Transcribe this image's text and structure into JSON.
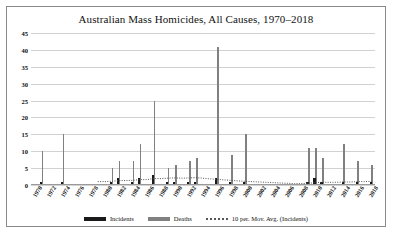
{
  "chart_data": {
    "type": "bar",
    "title": "Australian Mass Homicides, All Causes, 1970–2018",
    "xlabel": "",
    "ylabel": "",
    "ylim": [
      0,
      45
    ],
    "ytick_step": 5,
    "yticks": [
      "0",
      "5",
      "10",
      "15",
      "20",
      "25",
      "30",
      "35",
      "40",
      "45"
    ],
    "grid": true,
    "legend_position": "bottom",
    "x": [
      1970,
      1971,
      1972,
      1973,
      1974,
      1975,
      1976,
      1977,
      1978,
      1979,
      1980,
      1981,
      1982,
      1983,
      1984,
      1985,
      1986,
      1987,
      1988,
      1989,
      1990,
      1991,
      1992,
      1993,
      1994,
      1995,
      1996,
      1997,
      1998,
      1999,
      2000,
      2001,
      2002,
      2003,
      2004,
      2005,
      2006,
      2007,
      2008,
      2009,
      2010,
      2011,
      2012,
      2013,
      2014,
      2015,
      2016,
      2017,
      2018
    ],
    "xtick_labels": [
      "1970",
      "1972",
      "1974",
      "1976",
      "1978",
      "1980",
      "1982",
      "1984",
      "1986",
      "1988",
      "1990",
      "1992",
      "1994",
      "1996",
      "1998",
      "2000",
      "2002",
      "2004",
      "2006",
      "2008",
      "2010",
      "2012",
      "2014",
      "2016",
      "2018"
    ],
    "series": [
      {
        "name": "Deaths",
        "color": "#808080",
        "values": [
          0,
          10,
          0,
          0,
          15,
          0,
          0,
          0,
          0,
          0,
          0,
          5,
          7,
          0,
          7,
          12,
          0,
          25,
          0,
          5,
          6,
          0,
          7,
          8,
          0,
          0,
          41,
          0,
          9,
          0,
          15,
          0,
          0,
          0,
          0,
          0,
          0,
          0,
          0,
          11,
          11,
          8,
          0,
          0,
          12,
          0,
          7,
          0,
          6
        ]
      },
      {
        "name": "Incidents",
        "color": "#1a1a1a",
        "values": [
          0,
          1,
          0,
          0,
          1,
          0,
          0,
          0,
          0,
          0,
          0,
          1,
          2,
          0,
          1,
          2,
          0,
          3,
          0,
          1,
          1,
          0,
          1,
          1,
          0,
          0,
          2,
          0,
          1,
          0,
          1,
          0,
          0,
          0,
          0,
          0,
          0,
          0,
          0,
          1,
          2,
          1,
          0,
          0,
          1,
          0,
          1,
          0,
          1
        ]
      },
      {
        "name": "10 per. Mov. Avg. (Incidents)",
        "type": "line",
        "style": "dotted",
        "color": "#555555",
        "values": [
          null,
          null,
          null,
          null,
          null,
          null,
          null,
          null,
          null,
          1.0,
          1.0,
          1.1,
          1.3,
          1.3,
          1.4,
          1.6,
          1.6,
          1.9,
          1.9,
          2.0,
          2.1,
          2.0,
          2.1,
          2.2,
          2.0,
          1.8,
          1.7,
          1.5,
          1.4,
          1.2,
          1.1,
          1.0,
          0.9,
          0.8,
          0.7,
          0.6,
          0.5,
          0.4,
          0.4,
          0.5,
          0.7,
          0.8,
          0.8,
          0.8,
          0.9,
          0.9,
          1.0,
          1.0,
          1.1
        ]
      }
    ]
  },
  "legend": {
    "items": [
      {
        "label": "Incidents"
      },
      {
        "label": "Deaths"
      },
      {
        "label": "10 per. Mov. Avg. (Incidents)"
      }
    ]
  }
}
